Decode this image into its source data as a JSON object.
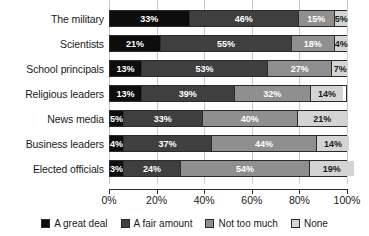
{
  "chart_data": {
    "type": "bar",
    "orientation": "horizontal",
    "stacked": true,
    "stack_mode": "percent",
    "title": "",
    "xlabel": "",
    "ylabel": "",
    "xlim": [
      0,
      100
    ],
    "xticks": [
      0,
      20,
      40,
      60,
      80,
      100
    ],
    "xticklabels": [
      "0%",
      "20%",
      "40%",
      "60%",
      "80%",
      "100%"
    ],
    "grid": true,
    "grid_axis": "x",
    "legend_position": "bottom",
    "categories": [
      "The military",
      "Scientists",
      "School principals",
      "Religious leaders",
      "News media",
      "Business leaders",
      "Elected officials"
    ],
    "series": [
      {
        "name": "A great deal",
        "color": "#0d0d0d",
        "values": [
          33,
          21,
          13,
          13,
          5,
          4,
          3
        ],
        "labels": [
          "33%",
          "21%",
          "13%",
          "13%",
          "5%",
          "4%",
          "3%"
        ]
      },
      {
        "name": "A fair amount",
        "color": "#3f3f3f",
        "values": [
          46,
          55,
          53,
          39,
          33,
          37,
          24
        ],
        "labels": [
          "46%",
          "55%",
          "53%",
          "39%",
          "33%",
          "37%",
          "24%"
        ]
      },
      {
        "name": "Not too much",
        "color": "#8f8f8f",
        "values": [
          15,
          18,
          27,
          32,
          40,
          44,
          54
        ],
        "labels": [
          "15%",
          "18%",
          "27%",
          "32%",
          "40%",
          "44%",
          "54%"
        ]
      },
      {
        "name": "None",
        "color": "#d4d4d4",
        "values": [
          5,
          4,
          7,
          14,
          21,
          14,
          19
        ],
        "labels": [
          "5%",
          "4%",
          "7%",
          "14%",
          "21%",
          "14%",
          "19%"
        ]
      }
    ]
  },
  "legend": {
    "items": [
      {
        "label": "A great deal"
      },
      {
        "label": "A fair amount"
      },
      {
        "label": "Not too much"
      },
      {
        "label": "None"
      }
    ]
  }
}
